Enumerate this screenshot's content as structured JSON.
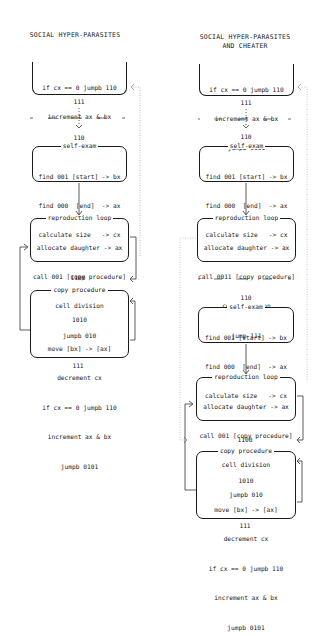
{
  "left": {
    "title": "SOCIAL HYPER-PARASITES",
    "top_box": {
      "lines": [
        "if cx == 0 jumpb 110",
        "increment ax & bx",
        "jumpb 0101"
      ]
    },
    "top_end_label": "111",
    "self_exam": {
      "pre_label": "110",
      "title": "self-exam",
      "lines": [
        "find 001 [start] -> bx",
        "find 000  [end]  -> ax",
        "calculate size   -> cx"
      ]
    },
    "reproduction": {
      "title": "reproduction loop",
      "lines": [
        "allocate daughter -> ax",
        "call 001 [copy procedure]",
        "cell division",
        "jumpb 010"
      ]
    },
    "copy": {
      "pre_label": "1100",
      "title": "copy procedure",
      "lines": [
        "1010",
        "move [bx] -> [ax]",
        "decrement cx",
        "if cx == 0 jumpb 110",
        "increment ax & bx",
        "jumpb 0101"
      ]
    },
    "end_label": "111"
  },
  "right": {
    "title_line1": "SOCIAL HYPER-PARASITES",
    "title_line2": "AND CHEATER",
    "top_box": {
      "lines": [
        "if cx == 0 jumpb 110",
        "increment ax & bx",
        "jumpb 0101"
      ]
    },
    "top_end_label": "111",
    "self_exam_1": {
      "pre_label": "110",
      "title": "self-exam",
      "lines": [
        "find 001 [start] -> bx",
        "find 000  [end]  -> ax",
        "calculate size   -> cx"
      ]
    },
    "reproduction_1": {
      "title": "reproduction loop",
      "lines": [
        "allocate daughter -> ax",
        "call 0011 [copy procedure]",
        "cell division",
        "jump 111"
      ]
    },
    "self_exam_2": {
      "pre_label": "110",
      "title": "self-exam",
      "lines": [
        "find 001 [start] -> bx",
        "find 000  [end]  -> ax",
        "calculate size   -> cx"
      ]
    },
    "reproduction_2": {
      "title": "reproduction loop",
      "lines": [
        "allocate daughter -> ax",
        "call 001 [copy procedure]",
        "cell division",
        "jumpb 010"
      ]
    },
    "copy": {
      "pre_label": "1100",
      "title": "copy procedure",
      "lines": [
        "1010",
        "move [bx] -> [ax]",
        "decrement cx",
        "if cx == 0 jumpb 110",
        "increment ax & bx",
        "jumpb 0101"
      ]
    },
    "end_label": "111"
  }
}
